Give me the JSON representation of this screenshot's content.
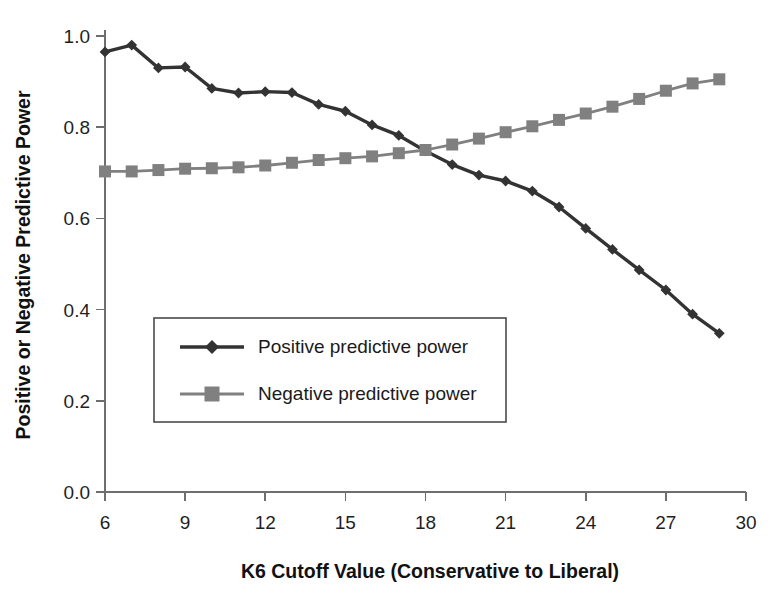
{
  "chart_data": {
    "type": "line",
    "title": "",
    "xlabel": "K6 Cutoff Value (Conservative to Liberal)",
    "ylabel": "Positive or Negative Predictive Power",
    "xlim": [
      6,
      30
    ],
    "ylim": [
      0.0,
      1.0
    ],
    "xticks": [
      6,
      9,
      12,
      15,
      18,
      21,
      24,
      27,
      30
    ],
    "xtick_labels": [
      "6",
      "9",
      "12",
      "15",
      "18",
      "21",
      "24",
      "27",
      "30"
    ],
    "yticks": [
      0.0,
      0.2,
      0.4,
      0.6,
      0.8,
      1.0
    ],
    "ytick_labels": [
      "0.0",
      "0.2",
      "0.4",
      "0.6",
      "0.8",
      "1.0"
    ],
    "grid": false,
    "legend_position": "center-left",
    "x": [
      6,
      7,
      8,
      9,
      10,
      11,
      12,
      13,
      14,
      15,
      16,
      17,
      18,
      19,
      20,
      21,
      22,
      23,
      24,
      25,
      26,
      27,
      28,
      29
    ],
    "series": [
      {
        "name": "Positive predictive power",
        "marker": "diamond",
        "color": "#333333",
        "values": [
          0.965,
          0.98,
          0.93,
          0.932,
          0.885,
          0.875,
          0.878,
          0.876,
          0.85,
          0.835,
          0.805,
          0.782,
          0.748,
          0.718,
          0.695,
          0.682,
          0.66,
          0.625,
          0.578,
          0.532,
          0.487,
          0.443,
          0.39,
          0.348
        ]
      },
      {
        "name": "Negative predictive power",
        "marker": "square",
        "color": "#808080",
        "values": [
          0.703,
          0.703,
          0.706,
          0.709,
          0.71,
          0.712,
          0.716,
          0.722,
          0.728,
          0.732,
          0.736,
          0.743,
          0.75,
          0.762,
          0.775,
          0.789,
          0.802,
          0.816,
          0.83,
          0.845,
          0.862,
          0.88,
          0.896,
          0.905
        ]
      }
    ]
  },
  "legend": {
    "entries": [
      {
        "label": "Positive predictive power"
      },
      {
        "label": "Negative predictive power"
      }
    ]
  }
}
